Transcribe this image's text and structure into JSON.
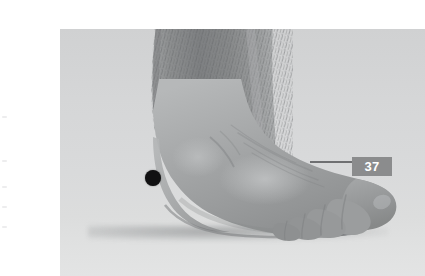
{
  "figure": {
    "kind": "anatomical-photograph",
    "view": "lateral view of right foot and lower leg",
    "color_mode": "grayscale",
    "alt": "Grayscale photograph of a lower leg and foot seen from the side, resting on a flat surface, with a single black dot marking a point just in front of and below the ankle bone.",
    "frame": {
      "x": 20,
      "y": 13,
      "width": 365,
      "height": 247,
      "background_color": "#d4d5d6"
    }
  },
  "markers": [
    {
      "name": "acupoint-dot",
      "label": "",
      "shape": "filled-circle",
      "color": "#111112",
      "center_x": 113,
      "center_y": 162,
      "radius": 8
    }
  ],
  "page_number": {
    "value": "37",
    "text_color": "#ffffff",
    "background_color": "#8b8c8d",
    "rule_color": "#6f7072"
  },
  "margin_artifacts": [
    {
      "top": 116
    },
    {
      "top": 160
    },
    {
      "top": 186
    },
    {
      "top": 206
    },
    {
      "top": 226
    }
  ]
}
